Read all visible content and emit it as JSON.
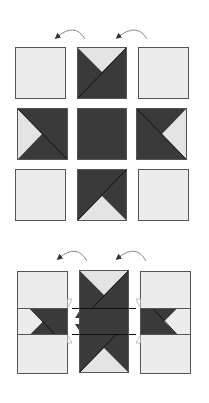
{
  "diagram": {
    "title": "",
    "colors": {
      "dark": "#3a3a3a",
      "light": "#ececec",
      "outline": "#555555",
      "arrow": "#777777",
      "background": "#ffffff"
    },
    "step1": {
      "label": "nine-patch layout",
      "arrows": [
        {
          "name": "arrow-left",
          "direction": "curving-left"
        },
        {
          "name": "arrow-right",
          "direction": "curving-left"
        }
      ],
      "grid": [
        [
          {
            "type": "plain"
          },
          {
            "type": "triangle-top"
          },
          {
            "type": "plain"
          }
        ],
        [
          {
            "type": "triangle-left"
          },
          {
            "type": "solid-dark"
          },
          {
            "type": "triangle-right"
          }
        ],
        [
          {
            "type": "plain"
          },
          {
            "type": "triangle-bottom"
          },
          {
            "type": "plain"
          }
        ]
      ]
    },
    "step2": {
      "label": "columns joined",
      "arrows": [
        {
          "name": "arrow-left",
          "direction": "curving-left"
        },
        {
          "name": "arrow-right",
          "direction": "curving-left"
        }
      ],
      "columns": [
        "left-column",
        "center-column",
        "right-column"
      ]
    }
  }
}
